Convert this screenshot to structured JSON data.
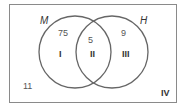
{
  "diagram": {
    "type": "venn",
    "sets": [
      {
        "name": "M",
        "label": "M"
      },
      {
        "name": "H",
        "label": "H"
      }
    ],
    "regions": [
      {
        "id": "I",
        "roman": "I",
        "value": "75"
      },
      {
        "id": "II",
        "roman": "II",
        "value": "5"
      },
      {
        "id": "III",
        "roman": "III",
        "value": "9"
      },
      {
        "id": "IV",
        "roman": "IV",
        "value": "11"
      }
    ],
    "colors": {
      "stroke": "#666666",
      "text": "#333333",
      "value_text": "#555555",
      "border": "#8a8a8a"
    }
  }
}
